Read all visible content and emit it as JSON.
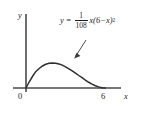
{
  "figure": {
    "name": "cubic-curve-plot",
    "background_color": "#ffffff",
    "axis_color": "#4a4a4a",
    "curve_color": "#2e2e2e",
    "text_color": "#1f1f1f"
  },
  "equation": {
    "lhs": "y",
    "equals": "=",
    "numerator": "1",
    "denominator": "108",
    "tail": "x(6−x)",
    "exponent": "2",
    "full_text": "y = 1/108 x(6−x)²"
  },
  "labels": {
    "y_axis": "y",
    "x_axis": "x",
    "origin": "0",
    "tick_6": "6"
  },
  "chart_data": {
    "type": "line",
    "title": "",
    "subtitle": "",
    "xlabel": "x",
    "ylabel": "y",
    "xlim": [
      -0.6,
      7.6
    ],
    "ylim": [
      -0.35,
      1.75
    ],
    "grid": false,
    "legend": null,
    "annotations": [
      {
        "text": "y = 1/108 x(6−x)²",
        "points_to": "curve",
        "arrow": true
      }
    ],
    "xticks": [
      0,
      6
    ],
    "xticklabels": [
      "0",
      "6"
    ],
    "yticks": [],
    "yticklabels": [],
    "series": [
      {
        "name": "y = (1/108)x(6-x)^2",
        "formula": "y = (1/108) * x * (6 - x)^2",
        "x": [
          0,
          0.25,
          0.5,
          0.75,
          1,
          1.25,
          1.5,
          1.75,
          2,
          2.25,
          2.5,
          2.75,
          3,
          3.25,
          3.5,
          3.75,
          4,
          4.25,
          4.5,
          4.75,
          5,
          5.25,
          5.5,
          5.75,
          6
        ],
        "values": [
          0,
          0.074,
          0.139,
          0.196,
          0.231,
          0.261,
          0.281,
          0.292,
          0.296,
          0.293,
          0.284,
          0.271,
          0.25,
          0.227,
          0.202,
          0.176,
          0.148,
          0.122,
          0.094,
          0.068,
          0.046,
          0.027,
          0.013,
          0.003,
          0
        ],
        "peak_x": 2,
        "peak_y": 0.296,
        "roots": [
          0,
          6
        ]
      }
    ]
  }
}
